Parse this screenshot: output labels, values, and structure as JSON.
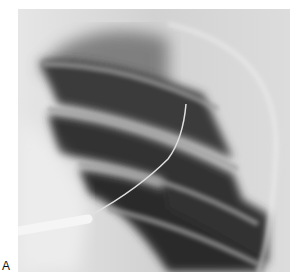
{
  "figure": {
    "panel_label": "A",
    "colors": {
      "background": "#e8e8e8",
      "lung_dark": "#2e2e2e",
      "rib_light": "#9a9a9a",
      "catheter": "#f2f2f2",
      "wire": "#d8d8d8"
    }
  }
}
